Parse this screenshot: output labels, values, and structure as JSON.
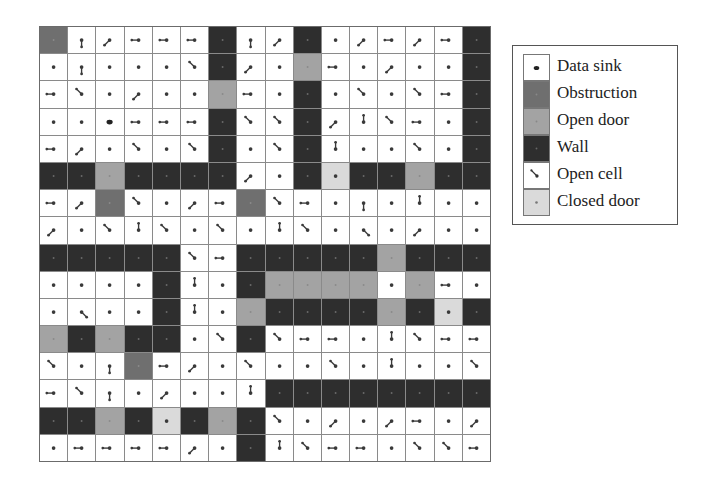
{
  "legend": {
    "items": [
      {
        "key": "sink",
        "label": "Data sink",
        "color": "#ffffff"
      },
      {
        "key": "obstruction",
        "label": "Obstruction",
        "color": "#6f6f6f"
      },
      {
        "key": "opendoor",
        "label": "Open door",
        "color": "#a3a3a3"
      },
      {
        "key": "wall",
        "label": "Wall",
        "color": "#2e2e2e"
      },
      {
        "key": "open",
        "label": "Open cell",
        "color": "#ffffff"
      },
      {
        "key": "closeddoor",
        "label": "Closed door",
        "color": "#dadada"
      }
    ]
  },
  "grid": {
    "rows": 16,
    "cols": 16,
    "cell_legend": "O=open, W=wall, B=obstruction, D=open door, C=closed door, S=data sink",
    "cells": [
      "BOOOOOWOOWOOOOOW",
      "OOOOOOWOODOOOOOW",
      "OOOOOODOOWOOOOOW",
      "OOSOOOWOOWOOOOOW",
      "OOOOOOWOOWOOOOOW",
      "WWDWWWWOOWCWWDWW",
      "OOBOOOOBOOOOOOOO",
      "OOOOOOOOOOOOOOOO",
      "WWWWWOOWWWWWDWWW",
      "OOOOWOOWDDDDODOO",
      "OOOOWOODWWWWDWCW",
      "DWDWWOOWOOOOOOOO",
      "OOOBOOOOOOOOOOOO",
      "OOOOOOOOWWWWWWWW",
      "WWDWCWDWOOOOOOOO",
      "OOOOOOOWOOOOOOOO"
    ],
    "arrows_note": "direction the line extends from the cell's dot: n,s,e,w,ne,nw,se,sw, or '.' for dot only",
    "arrows": [
      [
        "",
        "s",
        "sw",
        "w",
        "w",
        "w",
        "",
        "s",
        "sw",
        "",
        ".",
        "sw",
        "w",
        "sw",
        "w",
        ""
      ],
      [
        ".",
        "s",
        ".",
        ".",
        ".",
        "nw",
        "",
        "sw",
        ".",
        "",
        "w",
        ".",
        "sw",
        ".",
        ".",
        ""
      ],
      [
        "w",
        "nw",
        ".",
        "sw",
        ".",
        ".",
        "",
        "w",
        ".",
        "",
        ".",
        "nw",
        ".",
        "nw",
        "w",
        ""
      ],
      [
        ".",
        ".",
        "",
        "w",
        "w",
        "w",
        "",
        "nw",
        "nw",
        "",
        "sw",
        "n",
        "nw",
        "w",
        ".",
        ""
      ],
      [
        "w",
        "sw",
        ".",
        "nw",
        ".",
        "nw",
        "",
        ".",
        "nw",
        "",
        "n",
        ".",
        ".",
        "nw",
        ".",
        ""
      ],
      [
        "",
        "",
        "",
        "",
        "",
        "",
        "",
        "sw",
        ".",
        "",
        "",
        "",
        "",
        "",
        "",
        ""
      ],
      [
        "w",
        "sw",
        "",
        "nw",
        ".",
        "sw",
        "w",
        "",
        "nw",
        "w",
        ".",
        "s",
        ".",
        "n",
        ".",
        "."
      ],
      [
        "sw",
        ".",
        "nw",
        "n",
        "nw",
        ".",
        "nw",
        ".",
        "n",
        "nw",
        ".",
        "se",
        ".",
        "sw",
        ".",
        "."
      ],
      [
        "",
        "",
        "",
        "",
        "",
        "nw",
        "w",
        "",
        "",
        "",
        "",
        "",
        "",
        "",
        "",
        ""
      ],
      [
        ".",
        ".",
        ".",
        ".",
        "",
        "n",
        ".",
        "",
        "",
        "",
        "",
        "",
        ".",
        "",
        "w",
        "."
      ],
      [
        ".",
        "se",
        ".",
        ".",
        "",
        "n",
        ".",
        "",
        "",
        "",
        "",
        "",
        "",
        "",
        "",
        ""
      ],
      [
        "",
        "",
        "",
        "",
        "",
        ".",
        "nw",
        "",
        "nw",
        "w",
        "w",
        ".",
        "n",
        "nw",
        "w",
        "w"
      ],
      [
        "nw",
        ".",
        "s",
        "",
        "w",
        "sw",
        ".",
        "nw",
        ".",
        ".",
        "nw",
        ".",
        "n",
        ".",
        ".",
        "nw"
      ],
      [
        "w",
        "nw",
        "s",
        ".",
        "sw",
        ".",
        ".",
        "n",
        "",
        "",
        "",
        "",
        "",
        "",
        "",
        ""
      ],
      [
        "",
        "",
        "",
        "",
        "",
        "",
        "",
        "",
        "nw",
        ".",
        "sw",
        ".",
        "sw",
        "w",
        ".",
        "sw"
      ],
      [
        ".",
        "w",
        "w",
        "w",
        "w",
        "sw",
        ".",
        "",
        "n",
        "nw",
        "w",
        "w",
        ".",
        "nw",
        "nw",
        "w"
      ]
    ]
  },
  "colors": {
    "wall": "#2e2e2e",
    "obstruction": "#6f6f6f",
    "opendoor": "#a3a3a3",
    "closeddoor": "#dadada",
    "open": "#ffffff",
    "gridline": "#8a8a8a",
    "dot": "#3a3a3a"
  }
}
